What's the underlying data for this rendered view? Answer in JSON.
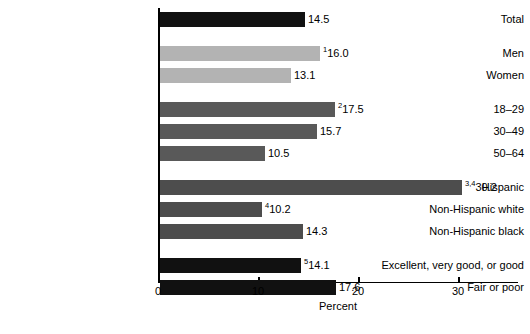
{
  "chart_data": {
    "type": "bar",
    "orientation": "horizontal",
    "title": "",
    "xlabel": "Percent",
    "ylabel": "",
    "xlim": [
      0,
      36
    ],
    "xticks": [
      0,
      10,
      20,
      30
    ],
    "xtick_labels": [
      "0",
      "10",
      "20",
      "30"
    ],
    "grid": false,
    "legend": "none",
    "categories": [
      "Total",
      "Men",
      "Women",
      "18–29",
      "30–49",
      "50–64",
      "Hispanic",
      "Non-Hispanic white",
      "Non-Hispanic black",
      "Excellent, very good, or good",
      "Fair or poor"
    ],
    "values": [
      14.5,
      16.0,
      13.1,
      17.5,
      15.7,
      10.5,
      30.2,
      10.2,
      14.3,
      14.1,
      17.6
    ],
    "value_labels": [
      "14.5",
      "16.0",
      "13.1",
      "17.5",
      "15.7",
      "10.5",
      "30.2",
      "10.2",
      "14.3",
      "14.1",
      "17.6"
    ],
    "superscripts": [
      "",
      "1",
      "",
      "2",
      "",
      "",
      "3,4",
      "4",
      "",
      "5",
      ""
    ],
    "colors": [
      "#111111",
      "#b3b3b3",
      "#b3b3b3",
      "#595959",
      "#595959",
      "#595959",
      "#4d4d4d",
      "#4d4d4d",
      "#4d4d4d",
      "#111111",
      "#111111"
    ],
    "groups": [
      {
        "name": "total",
        "indices": [
          0
        ]
      },
      {
        "name": "sex",
        "indices": [
          1,
          2
        ]
      },
      {
        "name": "age",
        "indices": [
          3,
          4,
          5
        ]
      },
      {
        "name": "race-ethnicity",
        "indices": [
          6,
          7,
          8
        ]
      },
      {
        "name": "health-status",
        "indices": [
          9,
          10
        ]
      }
    ]
  },
  "bars": [
    {
      "category": "Total",
      "value": 14.5,
      "label": "14.5",
      "sup": "",
      "color": "#111111",
      "top": 12
    },
    {
      "category": "Men",
      "value": 16.0,
      "label": "16.0",
      "sup": "1",
      "color": "#b3b3b3",
      "top": 46
    },
    {
      "category": "Women",
      "value": 13.1,
      "label": "13.1",
      "sup": "",
      "color": "#b3b3b3",
      "top": 68
    },
    {
      "category": "18–29",
      "value": 17.5,
      "label": "17.5",
      "sup": "2",
      "color": "#595959",
      "top": 102
    },
    {
      "category": "30–49",
      "value": 15.7,
      "label": "15.7",
      "sup": "",
      "color": "#595959",
      "top": 124
    },
    {
      "category": "50–64",
      "value": 10.5,
      "label": "10.5",
      "sup": "",
      "color": "#595959",
      "top": 146
    },
    {
      "category": "Hispanic",
      "value": 30.2,
      "label": "30.2",
      "sup": "3,4",
      "color": "#4d4d4d",
      "top": 180
    },
    {
      "category": "Non-Hispanic white",
      "value": 10.2,
      "label": "10.2",
      "sup": "4",
      "color": "#4d4d4d",
      "top": 202
    },
    {
      "category": "Non-Hispanic black",
      "value": 14.3,
      "label": "14.3",
      "sup": "",
      "color": "#4d4d4d",
      "top": 224
    },
    {
      "category": "Excellent, very good, or good",
      "value": 14.1,
      "label": "14.1",
      "sup": "5",
      "color": "#111111",
      "top": 258
    },
    {
      "category": "Fair or poor",
      "value": 17.6,
      "label": "17.6",
      "sup": "",
      "color": "#111111",
      "top": 280
    }
  ],
  "axis": {
    "x_title": "Percent",
    "ticks": [
      {
        "value": 0,
        "label": "0"
      },
      {
        "value": 10,
        "label": "10"
      },
      {
        "value": 20,
        "label": "20"
      },
      {
        "value": 30,
        "label": "30"
      }
    ]
  }
}
